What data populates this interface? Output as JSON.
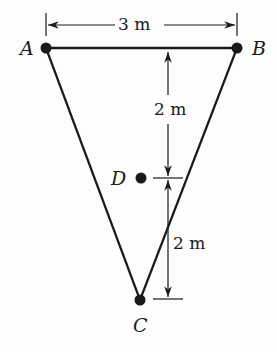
{
  "diagram": {
    "points": {
      "A": {
        "label": "A",
        "x": 46,
        "y": 48
      },
      "B": {
        "label": "B",
        "x": 237,
        "y": 48
      },
      "C": {
        "label": "C",
        "x": 140,
        "y": 300
      },
      "D": {
        "label": "D",
        "x": 141,
        "y": 178
      }
    },
    "dimensions": {
      "ab_width": "3 m",
      "upper_height": "2 m",
      "lower_height": "2 m"
    },
    "colors": {
      "line": "#1a1a1a",
      "background": "#fdfdfd"
    }
  }
}
